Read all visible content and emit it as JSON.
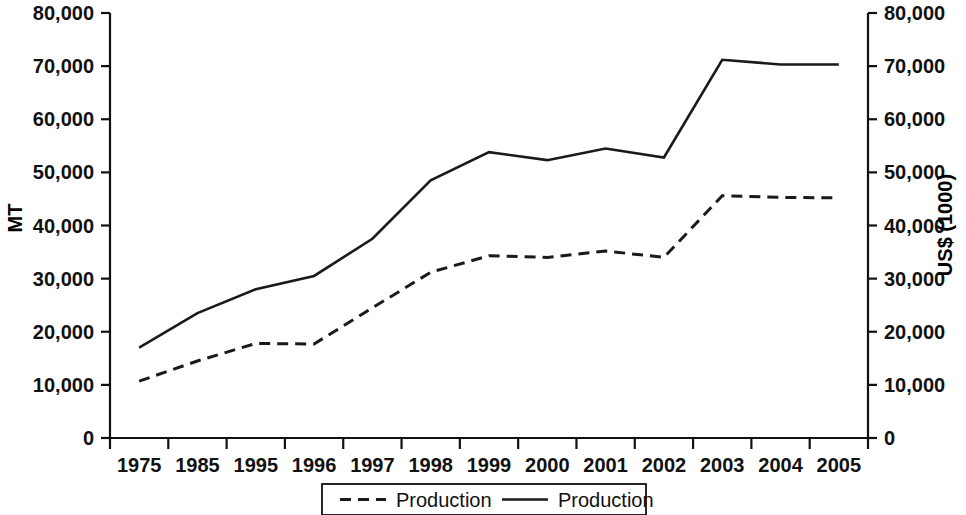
{
  "chart_data": {
    "type": "line",
    "title": "",
    "subtitle": "",
    "xlabel": "",
    "ylabel": "MT",
    "y2label": "US$ (1000)",
    "categories": [
      "1975",
      "1985",
      "1995",
      "1996",
      "1997",
      "1998",
      "1999",
      "2000",
      "2001",
      "2002",
      "2003",
      "2004",
      "2005"
    ],
    "ylim": [
      0,
      80000
    ],
    "y2lim": [
      0,
      80000
    ],
    "yticks": [
      "0",
      "10,000",
      "20,000",
      "30,000",
      "40,000",
      "50,000",
      "60,000",
      "70,000",
      "80,000"
    ],
    "ytick_values": [
      0,
      10000,
      20000,
      30000,
      40000,
      50000,
      60000,
      70000,
      80000
    ],
    "y2ticks": [
      "0",
      "10,000",
      "20,000",
      "30,000",
      "40,000",
      "50,000",
      "60,000",
      "70,000",
      "80,000"
    ],
    "grid": false,
    "legend_position": "bottom",
    "series": [
      {
        "name": "Production",
        "style": "dashed",
        "axis": "right",
        "unit": "US$ (1000)",
        "values": [
          10700,
          14500,
          17800,
          17700,
          24500,
          31200,
          34300,
          34000,
          35200,
          34000,
          45600,
          45300,
          45200
        ]
      },
      {
        "name": "Production",
        "style": "solid",
        "axis": "left",
        "unit": "MT",
        "values": [
          17000,
          23500,
          28000,
          30500,
          37500,
          48500,
          53800,
          52300,
          54500,
          52800,
          71200,
          70300,
          70300
        ]
      }
    ],
    "legend": [
      {
        "label": "Production",
        "style": "dashed"
      },
      {
        "label": "Production",
        "style": "solid"
      }
    ]
  }
}
